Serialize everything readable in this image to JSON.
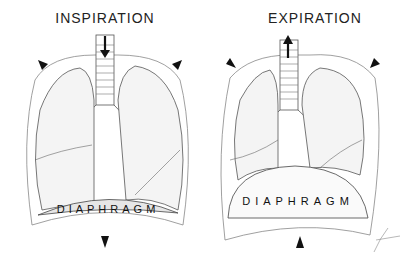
{
  "panels": [
    {
      "title": "INSPIRATION",
      "airflow": "in",
      "diaphragm_label": "DIAPHRAGM",
      "diaphragm_state": "flattened / descended",
      "chest_wall_arrows": "outward",
      "diaphragm_arrow": "down"
    },
    {
      "title": "EXPIRATION",
      "airflow": "out",
      "diaphragm_label": "DIAPHRAGM",
      "diaphragm_state": "domed / elevated",
      "chest_wall_arrows": "inward",
      "diaphragm_arrow": "up"
    }
  ],
  "colors": {
    "line": "#555555",
    "arrow": "#111111",
    "fill": "#f4f4f4"
  }
}
